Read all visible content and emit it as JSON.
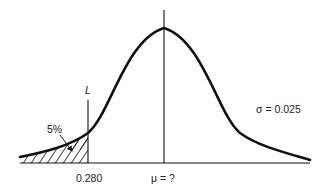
{
  "diagram": {
    "type": "normal-distribution-curve",
    "labels": {
      "limit_line": "L",
      "tail_area": "5%",
      "limit_value": "0.280",
      "mean": "μ = ?",
      "sigma": "σ = 0.025"
    },
    "colors": {
      "stroke": "#111111",
      "text": "#222222",
      "background": "#ffffff"
    },
    "parameters": {
      "sigma": 0.025,
      "lower_limit": 0.28,
      "tail_percent": 5,
      "mean": "unknown"
    }
  }
}
